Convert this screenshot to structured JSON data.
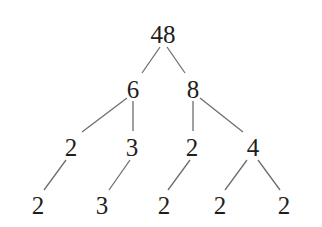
{
  "diagram": {
    "type": "factor-tree",
    "nodes": [
      {
        "id": "n48",
        "label": "48",
        "x": 163,
        "y": 34
      },
      {
        "id": "n6",
        "label": "6",
        "x": 133,
        "y": 89
      },
      {
        "id": "n8",
        "label": "8",
        "x": 193,
        "y": 89
      },
      {
        "id": "n2a",
        "label": "2",
        "x": 71,
        "y": 147
      },
      {
        "id": "n3a",
        "label": "3",
        "x": 132,
        "y": 147
      },
      {
        "id": "n2b",
        "label": "2",
        "x": 192,
        "y": 147
      },
      {
        "id": "n4",
        "label": "4",
        "x": 253,
        "y": 147
      },
      {
        "id": "n2c",
        "label": "2",
        "x": 38,
        "y": 205
      },
      {
        "id": "n3b",
        "label": "3",
        "x": 102,
        "y": 205
      },
      {
        "id": "n2d",
        "label": "2",
        "x": 164,
        "y": 205
      },
      {
        "id": "n2e",
        "label": "2",
        "x": 220,
        "y": 205
      },
      {
        "id": "n2f",
        "label": "2",
        "x": 284,
        "y": 205
      }
    ],
    "edges": [
      {
        "from": "n48",
        "to": "n6",
        "x1": 160,
        "y1": 47,
        "x2": 142,
        "y2": 73
      },
      {
        "from": "n48",
        "to": "n8",
        "x1": 167,
        "y1": 47,
        "x2": 185,
        "y2": 73
      },
      {
        "from": "n6",
        "to": "n2a",
        "x1": 127,
        "y1": 98,
        "x2": 82,
        "y2": 132
      },
      {
        "from": "n6",
        "to": "n3a",
        "x1": 133,
        "y1": 101,
        "x2": 133,
        "y2": 131
      },
      {
        "from": "n8",
        "to": "n2b",
        "x1": 193,
        "y1": 101,
        "x2": 193,
        "y2": 131
      },
      {
        "from": "n8",
        "to": "n4",
        "x1": 200,
        "y1": 98,
        "x2": 243,
        "y2": 132
      },
      {
        "from": "n2a",
        "to": "n2c",
        "x1": 66,
        "y1": 160,
        "x2": 44,
        "y2": 190
      },
      {
        "from": "n3a",
        "to": "n3b",
        "x1": 130,
        "y1": 160,
        "x2": 109,
        "y2": 190
      },
      {
        "from": "n2b",
        "to": "n2d",
        "x1": 190,
        "y1": 160,
        "x2": 168,
        "y2": 190
      },
      {
        "from": "n4",
        "to": "n2e",
        "x1": 247,
        "y1": 160,
        "x2": 225,
        "y2": 190
      },
      {
        "from": "n4",
        "to": "n2f",
        "x1": 258,
        "y1": 160,
        "x2": 280,
        "y2": 190
      }
    ],
    "colors": {
      "background": "#ffffff",
      "text": "#1e1e1e",
      "edge": "#6e6e6e"
    }
  }
}
